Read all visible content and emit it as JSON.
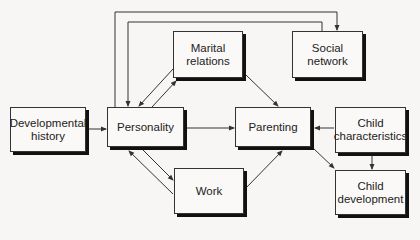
{
  "diagram": {
    "type": "flow",
    "nodes": [
      {
        "id": "developmental_history",
        "lines": [
          "Developmental",
          "history"
        ]
      },
      {
        "id": "personality",
        "lines": [
          "Personality"
        ]
      },
      {
        "id": "marital_relations",
        "lines": [
          "Marital",
          "relations"
        ]
      },
      {
        "id": "social_network",
        "lines": [
          "Social",
          "network"
        ]
      },
      {
        "id": "work",
        "lines": [
          "Work"
        ]
      },
      {
        "id": "parenting",
        "lines": [
          "Parenting"
        ]
      },
      {
        "id": "child_characteristics",
        "lines": [
          "Child",
          "characteristics"
        ]
      },
      {
        "id": "child_development",
        "lines": [
          "Child",
          "development"
        ]
      }
    ],
    "edges": [
      {
        "from": "developmental_history",
        "to": "personality"
      },
      {
        "from": "personality",
        "to": "parenting"
      },
      {
        "from": "personality",
        "to": "marital_relations"
      },
      {
        "from": "marital_relations",
        "to": "personality"
      },
      {
        "from": "personality",
        "to": "social_network"
      },
      {
        "from": "social_network",
        "to": "personality"
      },
      {
        "from": "personality",
        "to": "work"
      },
      {
        "from": "work",
        "to": "personality"
      },
      {
        "from": "marital_relations",
        "to": "parenting"
      },
      {
        "from": "work",
        "to": "parenting"
      },
      {
        "from": "child_characteristics",
        "to": "parenting"
      },
      {
        "from": "child_characteristics",
        "to": "child_development"
      },
      {
        "from": "parenting",
        "to": "child_development"
      }
    ],
    "colors": {
      "line": "#333333",
      "box_border": "#333333",
      "shadow": "#111111",
      "background": "#f7f6f4"
    }
  }
}
